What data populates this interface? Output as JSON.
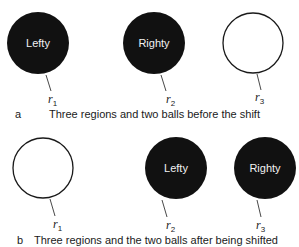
{
  "colors": {
    "ball_fill": "#111111",
    "ring_stroke": "#1a1a1a",
    "ball_text": "#f2f2f2",
    "text": "#1a1a1a"
  },
  "panels": [
    {
      "letter": "a",
      "caption": "Three regions and two balls before the shift",
      "regions": [
        {
          "name": "r",
          "sub": "1",
          "state": "filled",
          "ball_label": "Lefty"
        },
        {
          "name": "r",
          "sub": "2",
          "state": "filled",
          "ball_label": "Righty"
        },
        {
          "name": "r",
          "sub": "3",
          "state": "empty",
          "ball_label": ""
        }
      ]
    },
    {
      "letter": "b",
      "caption": "Three regions and the two balls after being shifted",
      "regions": [
        {
          "name": "r",
          "sub": "1",
          "state": "empty",
          "ball_label": ""
        },
        {
          "name": "r",
          "sub": "2",
          "state": "filled",
          "ball_label": "Lefty"
        },
        {
          "name": "r",
          "sub": "3",
          "state": "filled",
          "ball_label": "Righty"
        }
      ]
    }
  ]
}
